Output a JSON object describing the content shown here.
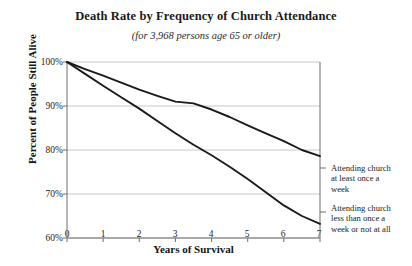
{
  "chart_data": {
    "type": "line",
    "title": "Death Rate by Frequency of Church Attendance",
    "subtitle": "(for 3,968 persons age 65 or older)",
    "xlabel": "Years of Survival",
    "ylabel": "Percent of People Still Alive",
    "xlim": [
      0,
      7
    ],
    "ylim": [
      60,
      100
    ],
    "xticks": [
      "0",
      "1",
      "2",
      "3",
      "4",
      "5",
      "6",
      "7"
    ],
    "yticks": [
      "100%",
      "90%",
      "80%",
      "70%",
      "60%"
    ],
    "ytick_values": [
      100,
      90,
      80,
      70,
      60
    ],
    "grid": "horizontal",
    "legend_position": "right-inline",
    "line_color": "#1a1a1a",
    "grid_color": "#c8c8c8",
    "axis_color": "#6e6e6e",
    "series": [
      {
        "name": "Attending church at least once a week",
        "x": [
          0,
          0.5,
          1,
          1.5,
          2,
          2.5,
          3,
          3.5,
          4,
          4.5,
          5,
          5.5,
          6,
          6.5,
          7
        ],
        "values": [
          100,
          98.4,
          96.9,
          95.3,
          93.7,
          92.3,
          91.0,
          90.6,
          89.2,
          87.5,
          85.6,
          83.8,
          82.0,
          80.0,
          78.6
        ]
      },
      {
        "name": "Attending church less than once a week or not at all",
        "x": [
          0,
          0.5,
          1,
          1.5,
          2,
          2.5,
          3,
          3.5,
          4,
          4.5,
          5,
          5.5,
          6,
          6.5,
          7
        ],
        "values": [
          100,
          97.3,
          94.6,
          92.0,
          89.4,
          86.6,
          83.8,
          81.2,
          78.8,
          76.2,
          73.4,
          70.4,
          67.4,
          65.0,
          63.2
        ]
      }
    ],
    "annotations": [
      "Attending church at least once a week",
      "Attending church less than once a week or not at all"
    ]
  },
  "legend": {
    "items": [
      {
        "line1": "Attending church",
        "line2": "at least once a",
        "line3": "week"
      },
      {
        "line1": "Attending church",
        "line2": "less than once a",
        "line3": "week or not at all"
      }
    ]
  }
}
